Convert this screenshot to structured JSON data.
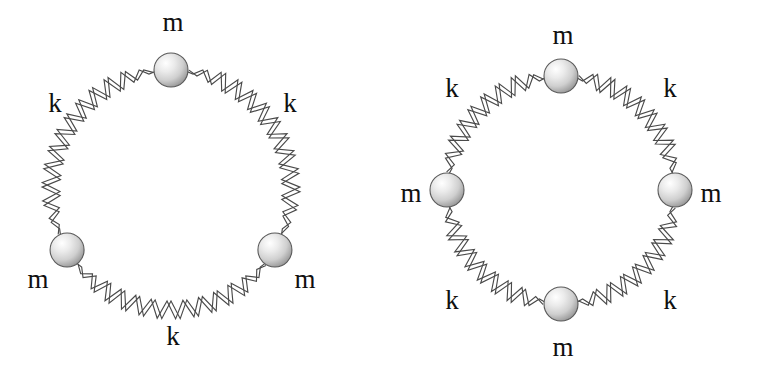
{
  "figure": {
    "background_color": "#ffffff",
    "spring_color": "#4a4a4a",
    "mass_fill_light": "#ffffff",
    "mass_fill_mid": "#d8d8d8",
    "mass_fill_dark": "#9a9a9a",
    "mass_outline_color": "#5a5a5a",
    "label_color": "#101010"
  },
  "panels": [
    {
      "id": "left",
      "name": "three-mass-ring",
      "center": {
        "x": 171,
        "y": 190
      },
      "radius": 120,
      "mass_count": 3,
      "spring_count": 3,
      "mass_radius": 17,
      "masses": [
        {
          "label": "m",
          "angle_deg": 90,
          "label_x": 173,
          "label_y": 22
        },
        {
          "label": "m",
          "angle_deg": 210,
          "label_x": 38,
          "label_y": 279
        },
        {
          "label": "m",
          "angle_deg": 330,
          "label_x": 305,
          "label_y": 279
        }
      ],
      "springs": [
        {
          "label": "k",
          "angle_deg": 150,
          "label_x": 55,
          "label_y": 103
        },
        {
          "label": "k",
          "angle_deg": 30,
          "label_x": 290,
          "label_y": 103
        },
        {
          "label": "k",
          "angle_deg": 270,
          "label_x": 173,
          "label_y": 336
        }
      ]
    },
    {
      "id": "right",
      "name": "four-mass-ring",
      "center": {
        "x": 561,
        "y": 190
      },
      "radius": 114,
      "mass_count": 4,
      "spring_count": 4,
      "mass_radius": 17,
      "masses": [
        {
          "label": "m",
          "angle_deg": 90,
          "label_x": 563,
          "label_y": 35
        },
        {
          "label": "m",
          "angle_deg": 180,
          "label_x": 411,
          "label_y": 193
        },
        {
          "label": "m",
          "angle_deg": 0,
          "label_x": 711,
          "label_y": 193
        },
        {
          "label": "m",
          "angle_deg": 270,
          "label_x": 563,
          "label_y": 347
        }
      ],
      "springs": [
        {
          "label": "k",
          "angle_deg": 135,
          "label_x": 452,
          "label_y": 88
        },
        {
          "label": "k",
          "angle_deg": 45,
          "label_x": 670,
          "label_y": 88
        },
        {
          "label": "k",
          "angle_deg": 225,
          "label_x": 452,
          "label_y": 300
        },
        {
          "label": "k",
          "angle_deg": 315,
          "label_x": 670,
          "label_y": 300
        }
      ]
    }
  ]
}
